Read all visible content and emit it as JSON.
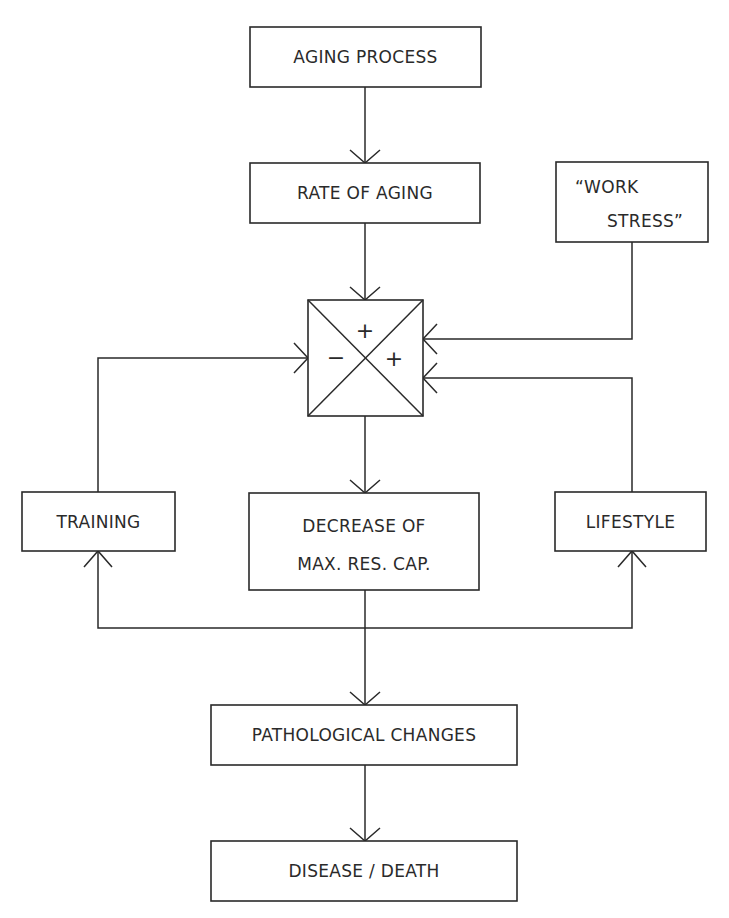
{
  "diagram": {
    "type": "flowchart",
    "stroke_color": "#2a2a2a",
    "background": "#ffffff",
    "nodes": {
      "aging_process": {
        "lines": [
          "AGING PROCESS"
        ]
      },
      "rate_of_aging": {
        "lines": [
          "RATE OF AGING"
        ]
      },
      "work_stress": {
        "lines": [
          "“WORK",
          "STRESS”"
        ]
      },
      "junction": {
        "signs": {
          "top": "+",
          "right": "+",
          "left": "−"
        }
      },
      "training": {
        "lines": [
          "TRAINING"
        ]
      },
      "decrease": {
        "lines": [
          "DECREASE OF",
          "MAX. RES. CAP."
        ]
      },
      "lifestyle": {
        "lines": [
          "LIFESTYLE"
        ]
      },
      "pathological": {
        "lines": [
          "PATHOLOGICAL CHANGES"
        ]
      },
      "disease": {
        "lines": [
          "DISEASE / DEATH"
        ]
      }
    },
    "edges": [
      {
        "from": "AGING PROCESS",
        "to": "RATE OF AGING"
      },
      {
        "from": "RATE OF AGING",
        "to": "junction (top, +)"
      },
      {
        "from": "“WORK STRESS”",
        "to": "junction (right, +)"
      },
      {
        "from": "LIFESTYLE",
        "to": "junction (right, +)"
      },
      {
        "from": "TRAINING",
        "to": "junction (left, −)"
      },
      {
        "from": "junction",
        "to": "DECREASE OF MAX. RES. CAP."
      },
      {
        "from": "DECREASE OF MAX. RES. CAP.",
        "to": "TRAINING"
      },
      {
        "from": "DECREASE OF MAX. RES. CAP.",
        "to": "LIFESTYLE"
      },
      {
        "from": "DECREASE OF MAX. RES. CAP.",
        "to": "PATHOLOGICAL CHANGES"
      },
      {
        "from": "PATHOLOGICAL CHANGES",
        "to": "DISEASE / DEATH"
      }
    ]
  }
}
